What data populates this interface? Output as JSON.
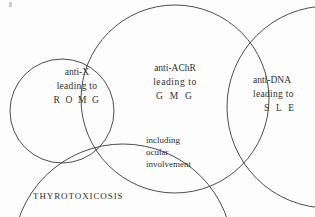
{
  "diagram": {
    "background_color": "#fdfdfd",
    "stroke_color": "#3a3a3a",
    "text_color": "#30302f",
    "sets": [
      {
        "id": "anti-x",
        "name": "anti-X set",
        "lines": [
          "anti-X",
          "leading to",
          "R O M G"
        ],
        "line1": "anti-X",
        "line2": "leading to",
        "line3": "R O M G"
      },
      {
        "id": "anti-achr",
        "name": "anti-AChR set",
        "lines": [
          "anti-AChR",
          "leading to",
          "G M G"
        ],
        "line1": "anti-AChR",
        "line2": "leading  to",
        "line3": "G M G",
        "sub1": "including",
        "sub2": "ocular",
        "sub3": "involvement"
      },
      {
        "id": "anti-dna",
        "name": "anti-DNA set",
        "lines": [
          "anti-DNA",
          "leading to",
          "S L E"
        ],
        "line1": "anti-DNA",
        "line2": "leading  to",
        "line3": "S L E"
      },
      {
        "id": "thyrotoxicosis",
        "name": "thyrotoxicosis set",
        "label": "THYROTOXICOSIS"
      }
    ],
    "circles": [
      {
        "id": "anti-x-circle",
        "cx": 62,
        "cy": 111,
        "r": 52
      },
      {
        "id": "anti-achr-circle",
        "cx": 175,
        "cy": 99,
        "r": 94
      },
      {
        "id": "anti-dna-circle",
        "cx": 328,
        "cy": 107,
        "r": 101
      },
      {
        "id": "thyrotoxicosis-circle",
        "cx": 123,
        "cy": 254,
        "r": 110
      }
    ]
  }
}
